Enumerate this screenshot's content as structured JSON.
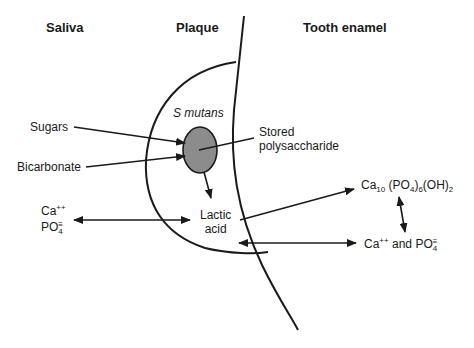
{
  "headers": {
    "saliva": "Saliva",
    "plaque": "Plaque",
    "enamel": "Tooth enamel"
  },
  "labels": {
    "s_mutans": "S mutans",
    "sugars": "Sugars",
    "bicarbonate": "Bicarbonate",
    "stored_line1": "Stored",
    "stored_line2": "polysaccharide",
    "lactic_line1": "Lactic",
    "lactic_line2": "acid",
    "saliva_ca": "Ca",
    "saliva_ca_charge": "++",
    "saliva_po": "PO",
    "saliva_po_sub": "4",
    "saliva_po_charge": "≡",
    "hap_ca": "Ca",
    "hap_ca_sub": "10",
    "hap_po": " (PO",
    "hap_po_sub": "4",
    "hap_po_close": ")",
    "hap_po_count": "6",
    "hap_oh": "(OH)",
    "hap_oh_sub": "2",
    "ions_ca": "Ca",
    "ions_ca_charge": "++",
    "ions_and": " and PO",
    "ions_po_sub": "4",
    "ions_po_charge": "≡"
  },
  "colors": {
    "line": "#1a1a1a",
    "bacterium_fill": "#8c8c8c"
  }
}
